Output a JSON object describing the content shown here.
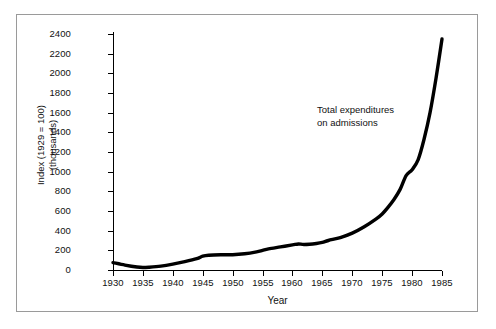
{
  "chart_data": {
    "type": "line",
    "title": "",
    "xlabel": "Year",
    "ylabel": "Index (1929 = 100)",
    "ylabel_line2": "(thousands)",
    "annotation": "Total  expenditures",
    "annotation_line2": "on admissions",
    "series_name": "Total expenditures on admissions",
    "grid": false,
    "legend_position": "none",
    "xlim": [
      1930,
      1985
    ],
    "ylim": [
      0,
      2400
    ],
    "xticks": [
      1930,
      1935,
      1940,
      1945,
      1950,
      1955,
      1960,
      1965,
      1970,
      1975,
      1980,
      1985
    ],
    "xtick_labels": [
      "1930",
      "1935",
      "1940",
      "1945",
      "1950",
      "1955",
      "1960",
      "1965",
      "1970",
      "1975",
      "1980",
      "1985"
    ],
    "yticks": [
      0,
      200,
      400,
      600,
      800,
      1000,
      1200,
      1400,
      1600,
      1800,
      2000,
      2200,
      2400
    ],
    "ytick_labels": [
      "0",
      "200",
      "400",
      "600",
      "800",
      "1000",
      "1200",
      "1400",
      "1600",
      "1800",
      "2000",
      "2200",
      "2400"
    ],
    "x": [
      1930,
      1932,
      1934,
      1935,
      1936,
      1938,
      1940,
      1942,
      1944,
      1945,
      1946,
      1948,
      1950,
      1952,
      1954,
      1955,
      1956,
      1958,
      1960,
      1961,
      1962,
      1964,
      1965,
      1966,
      1968,
      1970,
      1972,
      1974,
      1975,
      1976,
      1977,
      1978,
      1979,
      1980,
      1981,
      1982,
      1983,
      1984,
      1985
    ],
    "values": [
      75,
      50,
      30,
      25,
      28,
      40,
      60,
      85,
      115,
      140,
      150,
      155,
      155,
      165,
      185,
      200,
      215,
      235,
      255,
      265,
      260,
      270,
      280,
      300,
      330,
      375,
      440,
      520,
      570,
      640,
      720,
      820,
      960,
      1020,
      1120,
      1330,
      1600,
      1950,
      2350
    ],
    "line_color": "#000000",
    "line_width_px": 3.4,
    "axis_color": "#000000",
    "frame_color": "#9a9a9a",
    "background": "#ffffff"
  }
}
